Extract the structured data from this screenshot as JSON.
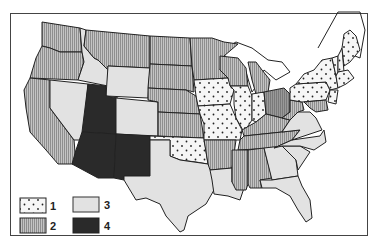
{
  "map": {
    "title": "",
    "region": "Contiguous United States",
    "classes": [
      {
        "id": "1",
        "label": "1",
        "pattern": "dots",
        "color": "#f4f4f4"
      },
      {
        "id": "2",
        "label": "2",
        "pattern": "vertical-stripes",
        "color": "#aaaaaa"
      },
      {
        "id": "3",
        "label": "3",
        "pattern": "light-solid",
        "color": "#e2e2e2"
      },
      {
        "id": "4",
        "label": "4",
        "pattern": "dark-solid",
        "color": "#2a2a2a"
      }
    ],
    "state_classes": {
      "Washington": "2",
      "Oregon": "2",
      "California": "2",
      "Idaho": "3",
      "Nevada": "3",
      "Montana": "2",
      "Wyoming": "3",
      "Utah": "4",
      "Arizona": "4",
      "Colorado": "3",
      "New Mexico": "4",
      "North Dakota": "2",
      "South Dakota": "2",
      "Nebraska": "2",
      "Kansas": "2",
      "Oklahoma": "1",
      "Texas": "3",
      "Minnesota": "2",
      "Iowa": "1",
      "Missouri": "1",
      "Arkansas": "2",
      "Louisiana": "3",
      "Wisconsin": "2",
      "Illinois": "1",
      "Michigan": "2",
      "Indiana": "1",
      "Ohio": "2",
      "Kentucky": "2",
      "Tennessee": "2",
      "Mississippi": "2",
      "Alabama": "2",
      "Georgia": "3",
      "Florida": "3",
      "South Carolina": "3",
      "North Carolina": "3",
      "Virginia": "3",
      "West Virginia": "2",
      "Pennsylvania": "1",
      "New York": "1",
      "Vermont": "1",
      "New Hampshire": "1",
      "Maine": "1",
      "Massachusetts": "1",
      "Connecticut": "1",
      "Rhode Island": "1",
      "New Jersey": "1",
      "Delaware": "2",
      "Maryland": "2"
    }
  }
}
